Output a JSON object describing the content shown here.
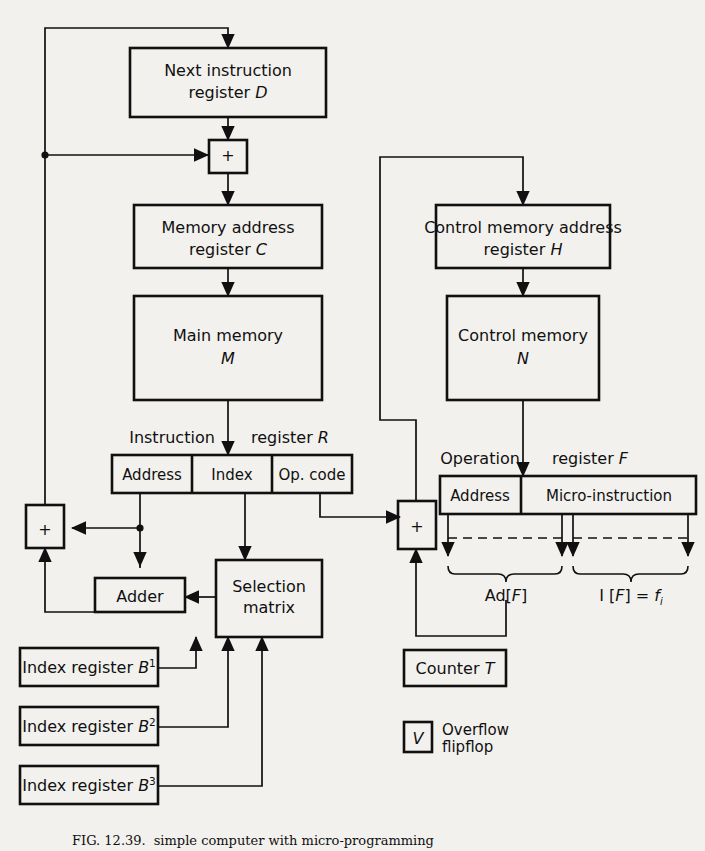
{
  "figure": {
    "caption_label": "FIG. 12.39.",
    "caption_text": "simple computer with micro-programming"
  },
  "boxes": {
    "next_instruction": {
      "line1": "Next instruction",
      "line2_pre": "register ",
      "line2_it": "D"
    },
    "memory_address": {
      "line1": "Memory address",
      "line2_pre": "register ",
      "line2_it": "C"
    },
    "main_memory": {
      "line1": "Main memory",
      "line2_it": "M"
    },
    "control_memory_address": {
      "line1": "Control memory address",
      "line2_pre": "register ",
      "line2_it": "H"
    },
    "control_memory": {
      "line1": "Control memory",
      "line2_it": "N"
    },
    "adder": {
      "label": "Adder"
    },
    "selection_matrix": {
      "line1": "Selection",
      "line2": "matrix"
    },
    "counter": {
      "pre": "Counter ",
      "it": "T"
    },
    "overflow": {
      "symbol": "V",
      "line1": "Overflow",
      "line2": "flipflop"
    },
    "plus_top": {
      "symbol": "+"
    },
    "plus_left": {
      "symbol": "+"
    },
    "plus_right": {
      "symbol": "+"
    }
  },
  "instruction_register": {
    "label_left": "Instruction",
    "label_right_pre": "register ",
    "label_right_it": "R",
    "fields": [
      "Address",
      "Index",
      "Op. code"
    ]
  },
  "operation_register": {
    "label_left": "Operation",
    "label_right_pre": "register ",
    "label_right_it": "F",
    "fields": [
      "Address",
      "Micro-instruction"
    ],
    "annotations": {
      "address_brace_pre": "Ad[",
      "address_brace_it": "F",
      "address_brace_post": "]",
      "micro_brace_pre": "I [",
      "micro_brace_it": "F",
      "micro_brace_mid": "] = ",
      "micro_brace_f": "f",
      "micro_brace_sub": "i"
    }
  },
  "index_registers": [
    {
      "pre": "Index register ",
      "it": "B",
      "sup": "1"
    },
    {
      "pre": "Index register ",
      "it": "B",
      "sup": "2"
    },
    {
      "pre": "Index register ",
      "it": "B",
      "sup": "3"
    }
  ],
  "colors": {
    "ink": "#101010",
    "paper": "#f3f1ee"
  }
}
